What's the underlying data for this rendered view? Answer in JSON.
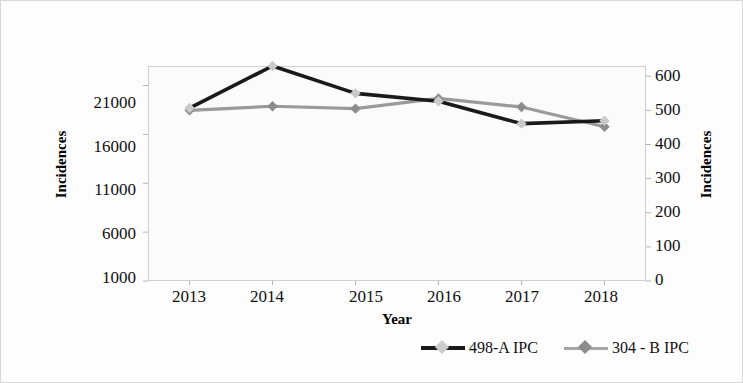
{
  "chart_data": {
    "type": "line",
    "title": "",
    "xlabel": "Year",
    "ylabel": "Incidences",
    "ylabel_right": "Incidences",
    "categories": [
      "2013",
      "2014",
      "2015",
      "2016",
      "2017",
      "2018"
    ],
    "grid": false,
    "legend_position": "bottom",
    "yaxis_left": {
      "label": "Incidences",
      "ticks": [
        "1000",
        "6000",
        "11000",
        "16000",
        "21000"
      ],
      "tick_values": [
        1000,
        6000,
        11000,
        16000,
        21000
      ],
      "ylim": [
        1000,
        23000
      ]
    },
    "yaxis_right": {
      "label": "Incidences",
      "ticks": [
        "0",
        "100",
        "200",
        "300",
        "400",
        "500",
        "600"
      ],
      "tick_values": [
        0,
        100,
        200,
        300,
        400,
        500,
        600
      ],
      "ylim": [
        0,
        630
      ]
    },
    "series": [
      {
        "name": "498-A IPC",
        "axis": "left",
        "color": "#1a1a1a",
        "marker": "diamond",
        "marker_color": "#c9c9c9",
        "values": [
          18700,
          23000,
          20200,
          19400,
          17100,
          17400
        ]
      },
      {
        "name": "304 - B IPC",
        "axis": "right",
        "color": "#9a9a9a",
        "marker": "diamond",
        "marker_color": "#8c8c8c",
        "values": [
          500,
          512,
          505,
          535,
          510,
          452
        ]
      }
    ]
  },
  "legend": {
    "items": [
      {
        "label": "498-A IPC",
        "line_color": "#1a1a1a",
        "marker_color": "#cdcdcd"
      },
      {
        "label": "304 - B IPC",
        "line_color": "#a5a5a5",
        "marker_color": "#8c8c8c"
      }
    ]
  }
}
